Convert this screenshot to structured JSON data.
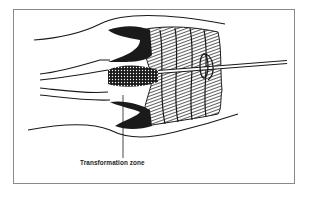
{
  "figure": {
    "label": "Transformation zone",
    "colors": {
      "ink": "#1a1a1a",
      "frame": "#8a8a8a",
      "background": "#ffffff"
    },
    "elements": [
      "vaginal-wall-outline",
      "cervix",
      "cervical-canal",
      "brush-bristles",
      "spatula-rod",
      "spatula-loop",
      "transformation-zone-pointer"
    ]
  }
}
